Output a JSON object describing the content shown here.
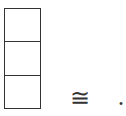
{
  "diagram": {
    "strip": {
      "orientation": "vertical",
      "cell_count": 3,
      "cells": [
        {
          "index": 0,
          "label": ""
        },
        {
          "index": 1,
          "label": ""
        },
        {
          "index": 2,
          "label": ""
        }
      ],
      "border_color": "#333333"
    },
    "relation_symbol": "≅",
    "trailing_punctuation": "."
  }
}
